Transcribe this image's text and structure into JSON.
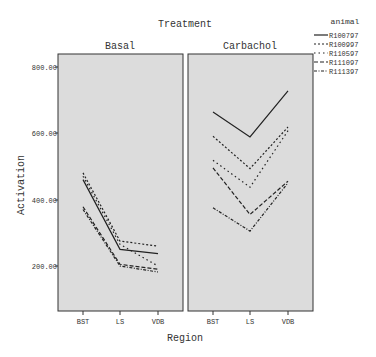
{
  "chart_data": {
    "type": "line",
    "title": "Treatment",
    "xlabel": "Region",
    "ylabel": "Activation",
    "categories": [
      "BST",
      "LS",
      "VDB"
    ],
    "ylim": [
      0,
      900
    ],
    "yticks": [
      "200.00",
      "400.00",
      "600.00",
      "800.00"
    ],
    "grid": false,
    "legend_title": "animal",
    "legend_position": "right",
    "panels": [
      {
        "name": "Basal",
        "series": [
          {
            "name": "R100797",
            "values": [
              460,
              250,
              237
            ]
          },
          {
            "name": "R100997",
            "values": [
              480,
              275,
              260
            ]
          },
          {
            "name": "R110597",
            "values": [
              470,
              265,
              200
            ]
          },
          {
            "name": "R111097",
            "values": [
              378,
              205,
              190
            ]
          },
          {
            "name": "R111397",
            "values": [
              370,
              200,
              182
            ]
          }
        ]
      },
      {
        "name": "Carbachol",
        "series": [
          {
            "name": "R100797",
            "values": [
              663,
              588,
              727
            ]
          },
          {
            "name": "R100997",
            "values": [
              590,
              493,
              618
            ]
          },
          {
            "name": "R110597",
            "values": [
              518,
              437,
              607
            ]
          },
          {
            "name": "R111097",
            "values": [
              495,
              355,
              455
            ]
          },
          {
            "name": "R111397",
            "values": [
              375,
              305,
              450
            ]
          }
        ]
      }
    ]
  },
  "labels": {
    "title": "Treatment",
    "panel1": "Basal",
    "panel2": "Carbachol",
    "xlabel": "Region",
    "ylabel": "Activation",
    "legend_title": "animal",
    "legend": [
      "R100797",
      "R100997",
      "R110597",
      "R111097",
      "R111397"
    ],
    "yticks": [
      "800.00",
      "600.00",
      "400.00",
      "200.00"
    ],
    "xticks": [
      "BST",
      "LS",
      "VDB"
    ]
  },
  "colors": {
    "panel_bg": "#dcdcdc",
    "line": "#222222",
    "frame": "#333333"
  }
}
